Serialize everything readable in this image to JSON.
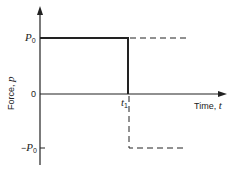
{
  "diagram": {
    "y_axis_label": "Force, ",
    "y_axis_var": "p",
    "x_axis_label": "Time, ",
    "x_axis_var": "t",
    "ticks": {
      "p0_sym": "P",
      "p0_sub": "0",
      "zero": "0",
      "neg_p0_prefix": "−",
      "neg_p0_sym": "P",
      "neg_p0_sub": "0",
      "t1_sym": "t",
      "t1_sub": "1"
    },
    "colors": {
      "line": "#222222",
      "background": "#ffffff"
    }
  }
}
